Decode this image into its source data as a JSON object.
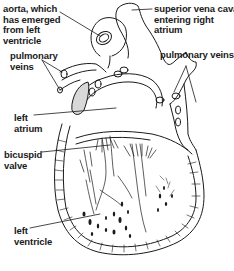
{
  "diagram": {
    "labels": [
      {
        "id": "aorta",
        "text": "aorta, which\nhas emerged\nfrom left\nventricle"
      },
      {
        "id": "superior-vena-cava",
        "text": "superior vena cava\nentering right\natrium"
      },
      {
        "id": "pulmonary-veins-left",
        "text": "pulmonary\nveins"
      },
      {
        "id": "pulmonary-veins-right",
        "text": "pulmonary veins"
      },
      {
        "id": "left-atrium",
        "text": "left\natrium"
      },
      {
        "id": "bicuspid-valve",
        "text": "bicuspid\nvalve"
      },
      {
        "id": "left-ventricle",
        "text": "left\nventricle"
      }
    ],
    "colors": {
      "ink": "#1a1a1a",
      "background": "#ffffff"
    }
  }
}
